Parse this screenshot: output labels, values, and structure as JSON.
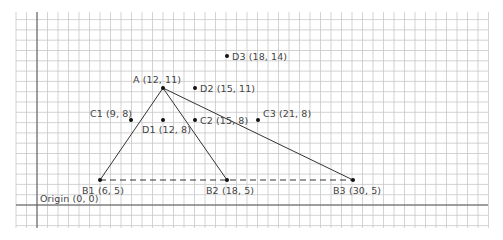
{
  "diagram": {
    "type": "coordinate-grid",
    "colors": {
      "grid": "#c8c8c8",
      "axis": "#555555",
      "segment": "#333333",
      "point": "#111111",
      "label": "#444444"
    },
    "origin_label": "Origin (0, 0)",
    "points": [
      {
        "id": "A",
        "label": "A (12, 11)",
        "x": 163,
        "y": 88,
        "lx": 133,
        "ly": 74,
        "align": "above"
      },
      {
        "id": "B1",
        "label": "B1 (6, 5)",
        "x": 100,
        "y": 180,
        "lx": 82,
        "ly": 185
      },
      {
        "id": "B2",
        "label": "B2 (18, 5)",
        "x": 227,
        "y": 180,
        "lx": 206,
        "ly": 185
      },
      {
        "id": "B3",
        "label": "B3 (30, 5)",
        "x": 353,
        "y": 180,
        "lx": 333,
        "ly": 185
      },
      {
        "id": "C1",
        "label": "C1 (9, 8)",
        "x": 131,
        "y": 120,
        "lx": 90,
        "ly": 108
      },
      {
        "id": "C2",
        "label": "C2 (15, 8)",
        "x": 195,
        "y": 120,
        "lx": 200,
        "ly": 115
      },
      {
        "id": "C3",
        "label": "C3 (21, 8)",
        "x": 258,
        "y": 120,
        "lx": 263,
        "ly": 108
      },
      {
        "id": "D1",
        "label": "D1 (12, 8)",
        "x": 163,
        "y": 120,
        "lx": 142,
        "ly": 124
      },
      {
        "id": "D2",
        "label": "D2 (15, 11)",
        "x": 195,
        "y": 88,
        "lx": 200,
        "ly": 83
      },
      {
        "id": "D3",
        "label": "D3 (18, 14)",
        "x": 227,
        "y": 56,
        "lx": 232,
        "ly": 51
      }
    ],
    "segments": [
      {
        "from": "A",
        "to": "B1",
        "style": "solid"
      },
      {
        "from": "A",
        "to": "B2",
        "style": "solid"
      },
      {
        "from": "A",
        "to": "B3",
        "style": "solid"
      },
      {
        "from": "B1",
        "to": "B3",
        "style": "dashed"
      }
    ]
  }
}
